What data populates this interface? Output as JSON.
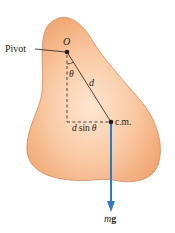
{
  "diagram": {
    "labels": {
      "pivot": "Pivot",
      "origin": "O",
      "angle": "θ",
      "distance": "d",
      "center_of_mass": "c.m.",
      "lever_arm": "d sin θ",
      "force_m": "m",
      "force_g": "g"
    },
    "colors": {
      "body_fill_light": "#fde0c8",
      "body_fill_dark": "#f2a878",
      "body_edge": "#c98058",
      "force_arrow": "#2e7bc4",
      "lines": "#231f20"
    }
  }
}
